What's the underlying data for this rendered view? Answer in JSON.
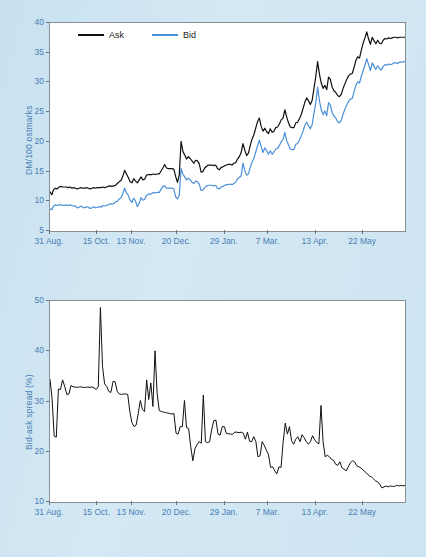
{
  "figure": {
    "background_color": "#cfe5f2",
    "ask_color": "#101010",
    "bid_color": "#4a90d9",
    "axis_text_color": "#4a7fb5"
  },
  "legend": {
    "ask_label": "Ask",
    "bid_label": "Bid"
  },
  "x_tick_labels": [
    "31 Aug.",
    "15 Oct.",
    "13 Nov.",
    "20 Dec.",
    "29 Jan.",
    "7 Mar.",
    "13 Apr.",
    "22 May"
  ],
  "top_panel": {
    "ylabel": "DM/100 ostmarks",
    "y_ticks": [
      "5",
      "10",
      "15",
      "20",
      "25",
      "30",
      "35",
      "40"
    ]
  },
  "bottom_panel": {
    "ylabel": "Bid-ask spread (%)",
    "y_ticks": [
      "10",
      "20",
      "30",
      "40",
      "50"
    ]
  },
  "chart_data": [
    {
      "type": "line",
      "title": "",
      "xlabel": "",
      "ylabel": "DM/100 ostmarks",
      "ylim": [
        5,
        40
      ],
      "xlim": [
        0,
        195
      ],
      "grid": false,
      "legend_position": "top-left",
      "x_tick_positions": [
        0,
        26,
        45,
        70,
        96,
        120,
        146,
        172
      ],
      "x_tick_labels": [
        "31 Aug.",
        "15 Oct.",
        "13 Nov.",
        "20 Dec.",
        "29 Jan.",
        "7 Mar.",
        "13 Apr.",
        "22 May"
      ],
      "y_ticks": [
        5,
        10,
        15,
        20,
        25,
        30,
        35,
        40
      ],
      "series": [
        {
          "name": "Ask",
          "color": "#101010",
          "values": [
            11.6,
            11.1,
            12.0,
            12.2,
            12.1,
            12.4,
            12.5,
            12.4,
            12.4,
            12.4,
            12.3,
            12.4,
            12.2,
            12.3,
            12.2,
            12.1,
            12.2,
            12.3,
            12.2,
            12.2,
            12.3,
            12.2,
            12.1,
            12.2,
            12.3,
            12.2,
            12.3,
            12.3,
            12.3,
            12.4,
            12.3,
            12.4,
            12.5,
            12.6,
            12.5,
            12.6,
            12.7,
            13.0,
            13.3,
            13.5,
            14.2,
            15.2,
            14.6,
            14.0,
            13.3,
            13.1,
            13.8,
            13.4,
            13.1,
            13.6,
            14.1,
            13.6,
            13.7,
            14.4,
            14.5,
            14.5,
            14.5,
            14.6,
            14.5,
            14.6,
            14.6,
            15.1,
            15.6,
            16.2,
            15.6,
            15.5,
            15.5,
            15.5,
            15.4,
            14.2,
            13.2,
            14.4,
            20.1,
            18.4,
            17.8,
            17.1,
            17.5,
            17.2,
            16.8,
            16.4,
            16.9,
            16.8,
            16.3,
            14.9,
            15.0,
            15.6,
            15.9,
            16.1,
            16.1,
            16.1,
            16.0,
            16.1,
            15.5,
            15.3,
            15.7,
            15.8,
            16.0,
            16.1,
            16.2,
            16.2,
            16.1,
            16.4,
            16.5,
            17.1,
            17.5,
            18.2,
            19.7,
            18.6,
            17.7,
            18.1,
            19.4,
            20.5,
            21.2,
            22.3,
            23.4,
            24.0,
            22.6,
            21.8,
            22.3,
            21.7,
            21.4,
            22.2,
            21.6,
            21.8,
            22.4,
            22.5,
            23.0,
            23.7,
            24.0,
            25.4,
            24.2,
            23.2,
            22.5,
            22.4,
            22.4,
            23.2,
            23.3,
            23.9,
            24.6,
            25.6,
            26.7,
            27.4,
            26.9,
            26.3,
            27.0,
            29.0,
            31.0,
            33.5,
            31.4,
            29.9,
            29.0,
            29.5,
            28.8,
            30.9,
            30.5,
            29.2,
            28.6,
            28.3,
            27.8,
            27.6,
            28.0,
            29.0,
            29.8,
            30.5,
            31.1,
            31.4,
            31.5,
            32.5,
            33.7,
            34.3,
            34.1,
            35.4,
            36.6,
            37.5,
            38.5,
            37.3,
            36.4,
            37.6,
            37.0,
            36.5,
            37.1,
            36.6,
            36.5,
            37.1,
            37.4,
            37.3,
            37.5,
            37.4,
            37.5,
            37.6,
            37.6,
            37.5,
            37.6,
            37.6,
            37.6,
            37.6
          ]
        },
        {
          "name": "Bid",
          "color": "#4a90d9",
          "values": [
            8.7,
            8.6,
            9.2,
            9.4,
            9.3,
            9.4,
            9.4,
            9.3,
            9.3,
            9.4,
            9.3,
            9.4,
            9.3,
            9.2,
            9.2,
            8.9,
            9.0,
            9.2,
            9.0,
            8.9,
            9.1,
            9.0,
            8.8,
            8.9,
            9.1,
            8.9,
            9.0,
            9.1,
            9.0,
            9.3,
            9.2,
            9.3,
            9.4,
            9.6,
            9.5,
            9.6,
            9.9,
            10.0,
            10.4,
            10.6,
            11.3,
            12.2,
            11.4,
            11.0,
            10.2,
            9.8,
            10.5,
            10.0,
            9.1,
            9.7,
            10.6,
            10.2,
            10.3,
            11.0,
            11.2,
            11.2,
            11.3,
            11.5,
            11.4,
            11.5,
            11.5,
            12.0,
            12.5,
            12.6,
            12.2,
            12.2,
            12.2,
            12.2,
            12.1,
            10.8,
            10.4,
            11.0,
            15.5,
            14.6,
            14.1,
            13.6,
            13.9,
            13.6,
            13.2,
            13.0,
            13.4,
            13.3,
            12.9,
            11.8,
            11.9,
            12.3,
            12.6,
            12.7,
            12.7,
            12.7,
            12.6,
            12.7,
            12.2,
            12.1,
            12.4,
            12.5,
            12.7,
            12.8,
            12.8,
            12.9,
            12.8,
            13.0,
            13.2,
            13.8,
            14.0,
            14.3,
            16.4,
            15.2,
            14.4,
            14.6,
            15.7,
            16.6,
            17.2,
            18.3,
            19.3,
            20.3,
            19.2,
            18.2,
            19.0,
            18.5,
            17.9,
            18.5,
            17.9,
            18.3,
            18.8,
            18.9,
            19.4,
            20.0,
            20.4,
            21.6,
            20.2,
            19.5,
            18.8,
            18.7,
            18.7,
            19.6,
            19.7,
            20.3,
            21.0,
            21.8,
            22.8,
            23.3,
            22.7,
            22.2,
            22.9,
            24.8,
            26.6,
            29.2,
            26.9,
            25.4,
            24.6,
            25.2,
            24.4,
            26.6,
            26.2,
            24.9,
            24.3,
            24.0,
            23.4,
            23.2,
            23.6,
            24.7,
            25.5,
            26.2,
            26.8,
            27.2,
            27.3,
            28.4,
            29.5,
            30.1,
            29.9,
            31.0,
            32.0,
            32.9,
            34.0,
            33.0,
            32.0,
            33.3,
            32.7,
            32.2,
            32.8,
            32.3,
            32.1,
            32.7,
            33.0,
            32.9,
            33.1,
            33.0,
            33.1,
            33.3,
            33.3,
            33.2,
            33.4,
            33.4,
            33.4,
            33.6
          ]
        }
      ]
    },
    {
      "type": "line",
      "title": "",
      "xlabel": "",
      "ylabel": "Bid-ask spread (%)",
      "ylim": [
        10,
        50
      ],
      "xlim": [
        0,
        195
      ],
      "grid": false,
      "legend_position": "none",
      "x_tick_positions": [
        0,
        26,
        45,
        70,
        96,
        120,
        146,
        172
      ],
      "x_tick_labels": [
        "31 Aug.",
        "15 Oct.",
        "13 Nov.",
        "20 Dec.",
        "29 Jan.",
        "7 Mar.",
        "13 Apr.",
        "22 May"
      ],
      "y_ticks": [
        10,
        20,
        30,
        40,
        50
      ],
      "series": [
        {
          "name": "Bid-ask spread",
          "color": "#101010",
          "values": [
            34.4,
            30.5,
            23.1,
            22.9,
            32.5,
            32.4,
            34.3,
            33.0,
            31.4,
            31.5,
            33.2,
            32.9,
            32.9,
            32.8,
            32.9,
            32.9,
            32.8,
            32.8,
            32.9,
            32.8,
            32.9,
            32.7,
            32.4,
            33.0,
            48.7,
            37.0,
            33.5,
            33.0,
            32.0,
            31.8,
            34.0,
            33.9,
            32.0,
            31.5,
            31.4,
            31.5,
            31.5,
            31.4,
            28.0,
            25.8,
            25.0,
            25.3,
            27.6,
            30.2,
            28.4,
            28.0,
            34.3,
            30.4,
            33.7,
            29.0,
            40.1,
            31.6,
            28.2,
            28.0,
            27.9,
            27.8,
            27.7,
            27.6,
            27.5,
            27.6,
            23.7,
            23.5,
            25.0,
            25.0,
            30.2,
            24.8,
            24.6,
            21.0,
            18.2,
            20.6,
            21.4,
            22.0,
            21.7,
            31.3,
            22.0,
            21.8,
            22.0,
            24.5,
            26.2,
            26.3,
            23.5,
            23.3,
            25.0,
            25.0,
            23.6,
            23.6,
            23.5,
            23.5,
            23.9,
            23.9,
            23.8,
            23.9,
            23.7,
            22.5,
            23.9,
            22.1,
            22.0,
            23.0,
            22.0,
            19.0,
            19.2,
            22.0,
            21.3,
            20.3,
            19.5,
            16.9,
            17.0,
            16.2,
            15.6,
            17.0,
            16.9,
            22.0,
            25.7,
            23.5,
            25.0,
            22.2,
            21.5,
            22.5,
            23.0,
            22.0,
            23.4,
            22.8,
            22.0,
            21.5,
            22.0,
            23.2,
            22.4,
            21.8,
            21.6,
            29.2,
            22.0,
            19.0,
            19.3,
            19.0,
            18.5,
            18.3,
            17.5,
            17.3,
            18.0,
            16.8,
            16.5,
            16.2,
            17.0,
            17.8,
            18.2,
            18.0,
            17.2,
            17.0,
            16.8,
            16.4,
            16.0,
            15.6,
            15.2,
            15.0,
            14.6,
            14.2,
            14.0,
            13.5,
            12.8,
            13.0,
            13.2,
            13.0,
            13.2,
            13.1,
            13.1,
            13.3,
            13.2,
            13.3,
            13.2,
            13.3
          ]
        }
      ]
    }
  ],
  "caption": ""
}
